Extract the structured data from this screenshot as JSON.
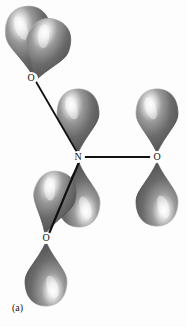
{
  "figure": {
    "caption": "(a)",
    "background_color": "#fdfdfd"
  },
  "atoms": [
    {
      "id": "o-top-left",
      "label": "O",
      "x": 31,
      "y": 78
    },
    {
      "id": "n-center",
      "label": "N",
      "x": 78,
      "y": 157
    },
    {
      "id": "o-right",
      "label": "O",
      "x": 157,
      "y": 157
    },
    {
      "id": "o-bottom-left",
      "label": "O",
      "x": 46,
      "y": 238
    }
  ],
  "bonds": [
    {
      "id": "bond-n-o-top-left",
      "from": "n-center",
      "to": "o-top-left",
      "x1": 78,
      "y1": 154,
      "x2": 35,
      "y2": 80,
      "width": 1.8
    },
    {
      "id": "bond-n-o-right",
      "from": "n-center",
      "to": "o-right",
      "x1": 84,
      "y1": 157,
      "x2": 153,
      "y2": 157,
      "width": 1.8
    },
    {
      "id": "bond-n-o-bottom-left",
      "from": "n-center",
      "to": "o-bottom-left",
      "x1": 79,
      "y1": 162,
      "x2": 48,
      "y2": 236,
      "width": 2.2
    }
  ],
  "lobes": [
    {
      "id": "lobe-o-top-left-upper",
      "atom": "o-top-left",
      "cx": 44,
      "cy": 43,
      "rx": 23,
      "ry": 35,
      "rotate": -6,
      "tip_x": 33,
      "tip_y": 76
    },
    {
      "id": "lobe-o-top-left-lower",
      "atom": "o-top-left",
      "cx": 26,
      "cy": 116,
      "rx": 22,
      "ry": 33,
      "rotate": 20,
      "tip_x": 34,
      "tip_y": 82
    },
    {
      "id": "lobe-n-upper",
      "atom": "n-center",
      "cx": 79,
      "cy": 122,
      "rx": 21,
      "ry": 32,
      "rotate": 0,
      "tip_x": 78,
      "tip_y": 153
    },
    {
      "id": "lobe-n-lower",
      "atom": "n-center",
      "cx": 80,
      "cy": 196,
      "rx": 21,
      "ry": 32,
      "rotate": 180,
      "tip_x": 79,
      "tip_y": 163
    },
    {
      "id": "lobe-o-right-upper",
      "atom": "o-right",
      "cx": 157,
      "cy": 122,
      "rx": 21,
      "ry": 32,
      "rotate": 0,
      "tip_x": 157,
      "tip_y": 153
    },
    {
      "id": "lobe-o-right-lower",
      "atom": "o-right",
      "cx": 157,
      "cy": 196,
      "rx": 21,
      "ry": 32,
      "rotate": 180,
      "tip_x": 157,
      "tip_y": 162
    },
    {
      "id": "lobe-o-bottom-left-upper",
      "atom": "o-bottom-left",
      "cx": 38,
      "cy": 201,
      "rx": 21,
      "ry": 32,
      "rotate": 14,
      "tip_x": 45,
      "tip_y": 234
    },
    {
      "id": "lobe-o-bottom-left-lower",
      "atom": "o-bottom-left",
      "cx": 47,
      "cy": 274,
      "rx": 21,
      "ry": 32,
      "rotate": 180,
      "tip_x": 46,
      "tip_y": 242
    }
  ],
  "colors": {
    "lobe_dark": "#4f4f4f",
    "lobe_mid": "#6e6e6e",
    "lobe_highlight": "#f2f2f2",
    "lobe_edge": "#3a3a3a",
    "bond_line": "#111111",
    "label_text": "#101010",
    "background": "#fdfdfd"
  }
}
